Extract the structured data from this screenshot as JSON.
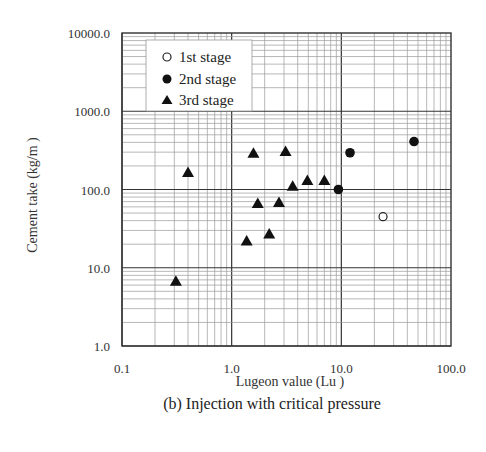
{
  "chart_data": {
    "type": "scatter",
    "title": "(b) Injection with critical pressure",
    "xlabel": "Lugeon value (Lu )",
    "ylabel": "Cement take (kg/m )",
    "xscale": "log",
    "yscale": "log",
    "xlim": [
      0.1,
      100.0
    ],
    "ylim": [
      1.0,
      10000.0
    ],
    "x_ticks": [
      "0.1",
      "1.0",
      "10.0",
      "100.0"
    ],
    "y_ticks": [
      "1.0",
      "10.0",
      "100.0",
      "1000.0",
      "10000.0"
    ],
    "grid": true,
    "legend_position": "upper-left",
    "series": [
      {
        "name": "1st stage",
        "marker": "open-circle",
        "points": [
          {
            "x": 24,
            "y": 45
          }
        ]
      },
      {
        "name": "2nd stage",
        "marker": "filled-circle",
        "points": [
          {
            "x": 9.4,
            "y": 100
          },
          {
            "x": 12,
            "y": 295
          },
          {
            "x": 46,
            "y": 410
          }
        ]
      },
      {
        "name": "3rd stage",
        "marker": "filled-triangle",
        "points": [
          {
            "x": 0.31,
            "y": 6.7
          },
          {
            "x": 0.4,
            "y": 165
          },
          {
            "x": 1.37,
            "y": 22
          },
          {
            "x": 1.58,
            "y": 290
          },
          {
            "x": 1.73,
            "y": 66
          },
          {
            "x": 2.2,
            "y": 27
          },
          {
            "x": 2.7,
            "y": 68
          },
          {
            "x": 3.1,
            "y": 305
          },
          {
            "x": 3.6,
            "y": 110
          },
          {
            "x": 4.9,
            "y": 130
          },
          {
            "x": 7.0,
            "y": 130
          }
        ]
      }
    ]
  },
  "legend": {
    "items": [
      {
        "label": "1st stage"
      },
      {
        "label": "2nd stage"
      },
      {
        "label": "3rd stage"
      }
    ]
  },
  "labels": {
    "xlabel": "Lugeon value (Lu )",
    "ylabel": "Cement take (kg/m )",
    "caption": "(b) Injection with critical pressure"
  }
}
